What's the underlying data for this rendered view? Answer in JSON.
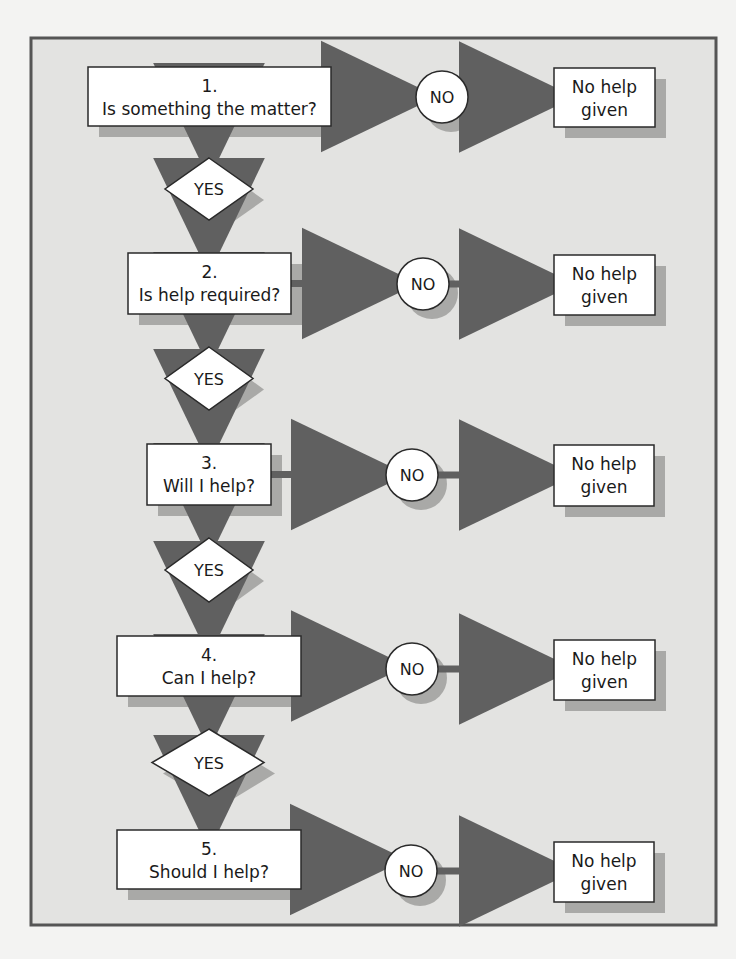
{
  "diagram": {
    "type": "flowchart",
    "colors": {
      "page_bg": "#f3f3f2",
      "panel_bg": "#e3e3e1",
      "panel_border": "#555555",
      "node_fill": "#ffffff",
      "node_stroke": "#2a2a2a",
      "shadow": "#a9a9a7",
      "arrow": "#606060",
      "text": "#1a1a1a"
    },
    "panel": {
      "x": 31,
      "y": 38,
      "w": 685,
      "h": 887
    },
    "steps": [
      {
        "number": "1.",
        "question": "Is something the matter?",
        "box": {
          "x": 88,
          "y": 67,
          "w": 243,
          "h": 59
        },
        "no": {
          "label": "NO",
          "cx": 442,
          "cy": 97,
          "r": 26
        },
        "outcome": {
          "line1": "No help",
          "line2": "given",
          "x": 554,
          "y": 68,
          "w": 101,
          "h": 59
        },
        "yes": {
          "label": "YES",
          "cx": 209,
          "top": 158,
          "bottom": 220,
          "left": 165,
          "right": 253
        }
      },
      {
        "number": "2.",
        "question": "Is help required?",
        "box": {
          "x": 128,
          "y": 253,
          "w": 163,
          "h": 61
        },
        "no": {
          "label": "NO",
          "cx": 423,
          "cy": 284,
          "r": 26
        },
        "outcome": {
          "line1": "No help",
          "line2": "given",
          "x": 554,
          "y": 255,
          "w": 101,
          "h": 60
        },
        "yes": {
          "label": "YES",
          "cx": 209,
          "top": 347,
          "bottom": 410,
          "left": 165,
          "right": 253
        }
      },
      {
        "number": "3.",
        "question": "Will I help?",
        "box": {
          "x": 147,
          "y": 444,
          "w": 124,
          "h": 61
        },
        "no": {
          "label": "NO",
          "cx": 412,
          "cy": 475,
          "r": 26
        },
        "outcome": {
          "line1": "No help",
          "line2": "given",
          "x": 554,
          "y": 445,
          "w": 100,
          "h": 61
        },
        "yes": {
          "label": "YES",
          "cx": 209,
          "top": 538,
          "bottom": 602,
          "left": 165,
          "right": 253
        }
      },
      {
        "number": "4.",
        "question": "Can I help?",
        "box": {
          "x": 117,
          "y": 636,
          "w": 184,
          "h": 60
        },
        "no": {
          "label": "NO",
          "cx": 412,
          "cy": 669,
          "r": 26
        },
        "outcome": {
          "line1": "No help",
          "line2": "given",
          "x": 554,
          "y": 640,
          "w": 101,
          "h": 60
        },
        "yes": {
          "label": "YES",
          "cx": 209,
          "top": 729,
          "bottom": 796,
          "left": 152,
          "right": 264
        }
      },
      {
        "number": "5.",
        "question": "Should I help?",
        "box": {
          "x": 117,
          "y": 830,
          "w": 184,
          "h": 59
        },
        "no": {
          "label": "NO",
          "cx": 411,
          "cy": 871,
          "r": 26
        },
        "outcome": {
          "line1": "No help",
          "line2": "given",
          "x": 554,
          "y": 842,
          "w": 100,
          "h": 60
        },
        "yes": null
      }
    ]
  }
}
